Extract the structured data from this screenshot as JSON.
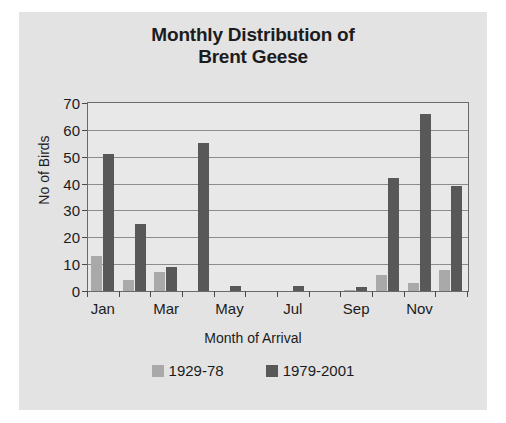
{
  "chart_data": {
    "type": "bar",
    "title": "Monthly Distribution of Brent Geese",
    "title_lines": [
      "Monthly Distribution of",
      "Brent Geese"
    ],
    "xlabel": "Month of Arrival",
    "ylabel": "No of Birds",
    "ylim": [
      0,
      70
    ],
    "yticks": [
      0,
      10,
      20,
      30,
      40,
      50,
      60,
      70
    ],
    "grid": true,
    "grid_axis": "y",
    "legend_position": "bottom",
    "categories": [
      "Jan",
      "Feb",
      "Mar",
      "Apr",
      "May",
      "Jun",
      "Jul",
      "Aug",
      "Sep",
      "Oct",
      "Nov",
      "Dec"
    ],
    "xtick_labels_shown": [
      "Jan",
      "Mar",
      "May",
      "Jul",
      "Sep",
      "Nov"
    ],
    "series": [
      {
        "name": "1929-78",
        "color": "#a9a9a9",
        "values": [
          13,
          4,
          7,
          0,
          0,
          0,
          0,
          0,
          0.5,
          6,
          3,
          8
        ]
      },
      {
        "name": "1979-2001",
        "color": "#585858",
        "values": [
          51,
          25,
          9,
          55,
          2,
          0,
          2,
          0,
          1.5,
          42,
          66,
          39
        ]
      }
    ]
  },
  "figure": {
    "background_color": "#e3e3e3",
    "plot_background_color": "#e8e8e8",
    "axis_color": "#6a6a6a",
    "gridline_color": "#8c8c8c"
  }
}
